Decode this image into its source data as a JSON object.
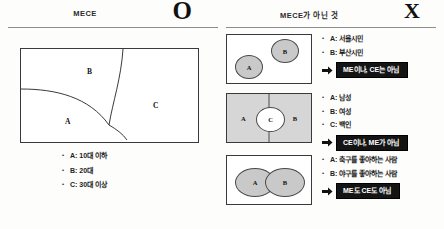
{
  "left": {
    "title": "MECE",
    "mark": "O",
    "mark_name": "circle-mark",
    "diagram": {
      "regions": [
        {
          "id": "A",
          "label": "A"
        },
        {
          "id": "B",
          "label": "B"
        },
        {
          "id": "C",
          "label": "C"
        }
      ]
    },
    "bullets": [
      "A: 10대 이하",
      "B: 20대",
      "C: 30대 이상"
    ]
  },
  "right": {
    "title": "MECE가 아닌 것",
    "mark": "X",
    "mark_name": "cross-mark",
    "rows": [
      {
        "diagram_type": "two-separate-circles",
        "shapes": [
          {
            "label": "A"
          },
          {
            "label": "B"
          }
        ],
        "bullets": [
          "A: 서울시민",
          "B: 부산시민"
        ],
        "banner": "ME이나, CE는 아님"
      },
      {
        "diagram_type": "split-box-with-center-circle",
        "shapes": [
          {
            "label": "A"
          },
          {
            "label": "C"
          },
          {
            "label": "B"
          }
        ],
        "bullets": [
          "A: 남성",
          "B: 여성",
          "C: 백인"
        ],
        "banner": "CE이나, ME가 아님"
      },
      {
        "diagram_type": "two-overlapping-circles",
        "shapes": [
          {
            "label": "A"
          },
          {
            "label": "B"
          }
        ],
        "bullets": [
          "A: 축구를 좋아하는 사람",
          "B: 야구를 좋아하는 사람"
        ],
        "banner": "ME도 CE도 아님"
      }
    ]
  },
  "colors": {
    "banner_bg": "#141414",
    "banner_fg": "#ffffff",
    "shape_fill": "#c9c9c9",
    "box_fill": "#d6d6d6",
    "line": "#3a3a3a"
  }
}
